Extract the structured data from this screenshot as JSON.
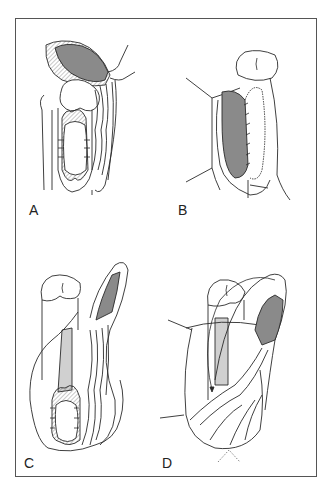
{
  "figure": {
    "panels": [
      {
        "id": "A",
        "label": "A"
      },
      {
        "id": "B",
        "label": "B"
      },
      {
        "id": "C",
        "label": "C"
      },
      {
        "id": "D",
        "label": "D"
      }
    ],
    "colors": {
      "line": "#2a2a2a",
      "flap_fill": "#8a8a8a",
      "border": "#555555",
      "background": "#ffffff"
    }
  }
}
